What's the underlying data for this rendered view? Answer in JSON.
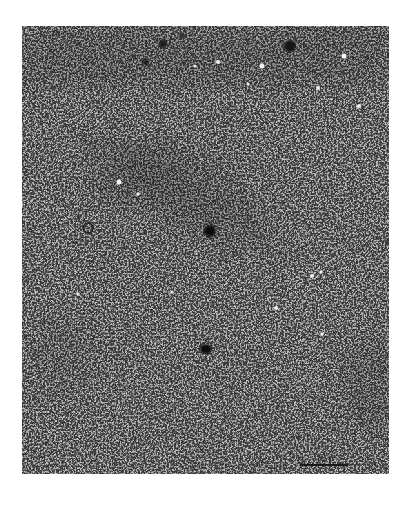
{
  "figure": {
    "type": "electron-micrograph",
    "colors": {
      "background": "#ffffff",
      "field": "#bdbdbd",
      "dark_particles": "#1a1a1a",
      "band_shadow": "#8a8a8a"
    },
    "scale_bar": {
      "label": "10 μ"
    }
  }
}
